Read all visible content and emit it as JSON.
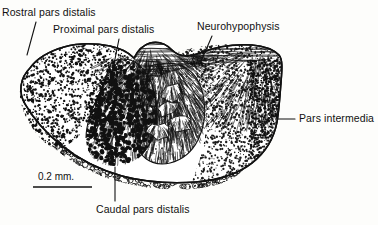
{
  "figure": {
    "background_color": "#fdfdfb",
    "ink_color": "#111111",
    "labels": [
      {
        "id": "rostral-pars-distalis",
        "text": "Rostral pars distalis",
        "x": 2,
        "y": 7,
        "leader": {
          "x1": 36,
          "y1": 22,
          "x2": 27,
          "y2": 55
        }
      },
      {
        "id": "proximal-pars-distalis",
        "text": "Proximal pars distalis",
        "x": 53,
        "y": 24,
        "leader": {
          "x1": 119,
          "y1": 39,
          "x2": 112,
          "y2": 74
        }
      },
      {
        "id": "neurohypophysis",
        "text": "Neurohypophysis",
        "x": 197,
        "y": 21,
        "leader": {
          "x1": 212,
          "y1": 36,
          "x2": 199,
          "y2": 66
        }
      },
      {
        "id": "pars-intermedia",
        "text": "Pars intermedia",
        "x": 299,
        "y": 113,
        "leader": {
          "x1": 276,
          "y1": 119,
          "x2": 295,
          "y2": 119
        }
      },
      {
        "id": "caudal-pars-distalis",
        "text": "Caudal pars distalis",
        "x": 96,
        "y": 204,
        "leader": {
          "x1": 115,
          "y1": 167,
          "x2": 115,
          "y2": 201
        }
      }
    ],
    "scale_bar": {
      "label": "0.2 mm.",
      "label_x": 38,
      "label_y": 171,
      "line_x1": 33,
      "line_x2": 92,
      "line_y": 187
    }
  },
  "chart_data": {
    "type": "diagram",
    "regions": [
      {
        "name": "Rostral pars distalis",
        "texture": "fine-stipple",
        "location": "left lobe"
      },
      {
        "name": "Proximal pars distalis",
        "texture": "dense-filled-dots",
        "location": "central lobe"
      },
      {
        "name": "Caudal pars distalis",
        "texture": "open-circles",
        "location": "ventral margin"
      },
      {
        "name": "Neurohypophysis",
        "texture": "fine-hatching",
        "location": "dorsal and branching core"
      },
      {
        "name": "Pars intermedia",
        "texture": "coarse-stipple",
        "location": "right lobe"
      }
    ],
    "scale": {
      "value": 0.2,
      "unit": "mm"
    }
  }
}
